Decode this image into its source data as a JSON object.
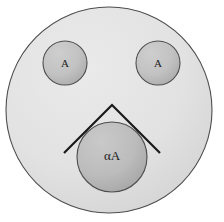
{
  "figure": {
    "name": "nested-circles-diagram",
    "background_color": "#ffffff",
    "canvas": {
      "width": 224,
      "height": 222
    }
  },
  "outer_circle": {
    "name": "outer-boundary-circle",
    "fill": "#e0e0e0",
    "stroke": "#4d4d4d",
    "cx": 109,
    "cy": 110,
    "r": 103
  },
  "inner_circles": [
    {
      "id": "left-eye",
      "label": "A",
      "cx": 65,
      "cy": 63,
      "r": 22,
      "fill": "#bdbdbd",
      "stroke": "#4d4d4d"
    },
    {
      "id": "right-eye",
      "label": "A",
      "cx": 158,
      "cy": 63,
      "r": 22,
      "fill": "#bdbdbd",
      "stroke": "#4d4d4d"
    },
    {
      "id": "mouth-circle",
      "label": "αA",
      "cx": 112,
      "cy": 157,
      "r": 35,
      "fill": "#b8b8b8",
      "stroke": "#4d4d4d"
    }
  ],
  "chevron": {
    "name": "chevron-angle-marker",
    "stroke": "#1a1a1a",
    "stroke_width": 2,
    "points": "64,153 112,105 160,153",
    "apex": {
      "x": 112,
      "y": 105
    },
    "left_end": {
      "x": 64,
      "y": 153
    },
    "right_end": {
      "x": 160,
      "y": 153
    }
  }
}
